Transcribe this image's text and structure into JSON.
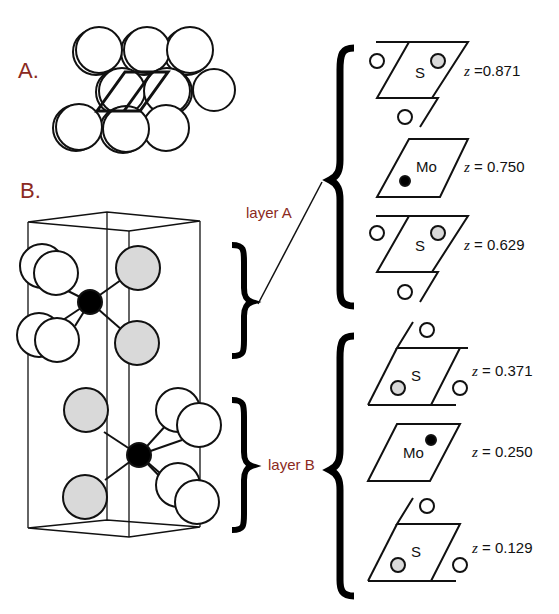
{
  "figure": {
    "panel_a": {
      "label": "A."
    },
    "panel_b": {
      "label": "B."
    },
    "layers": [
      {
        "label": "layer A"
      },
      {
        "label": "layer B"
      }
    ],
    "planes": [
      {
        "atom": "S",
        "z_var": "z",
        "z_text": " =0.871"
      },
      {
        "atom": "Mo",
        "z_var": "z",
        "z_text": " = 0.750"
      },
      {
        "atom": "S",
        "z_var": "z",
        "z_text": " = 0.629"
      },
      {
        "atom": "S",
        "z_var": "z",
        "z_text": " = 0.371"
      },
      {
        "atom": "Mo",
        "z_var": "z",
        "z_text": " = 0.250"
      },
      {
        "atom": "S",
        "z_var": "z",
        "z_text": " = 0.129"
      }
    ],
    "colors": {
      "label_red": "#8b2a22",
      "s_gray": "#d9d9d9",
      "mo_black": "#000000",
      "line": "#111111"
    }
  }
}
